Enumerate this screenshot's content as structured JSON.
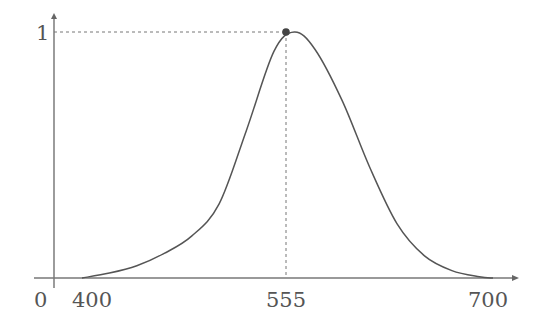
{
  "chart_data": {
    "type": "line",
    "title": "",
    "xlabel": "",
    "ylabel": "",
    "x_ticks": [
      "400",
      "555",
      "700"
    ],
    "y_ticks": [
      "1"
    ],
    "origin_label": "0",
    "xlim": [
      380,
      720
    ],
    "ylim": [
      0,
      1
    ],
    "grid": false,
    "series": [
      {
        "name": "luminosity curve",
        "x": [
          400,
          420,
          440,
          460,
          480,
          500,
          520,
          540,
          555,
          570,
          590,
          610,
          630,
          650,
          670,
          690,
          700
        ],
        "y": [
          0.0,
          0.02,
          0.05,
          0.1,
          0.17,
          0.3,
          0.6,
          0.92,
          1.0,
          0.93,
          0.72,
          0.45,
          0.22,
          0.09,
          0.03,
          0.005,
          0.0
        ]
      }
    ],
    "annotations": [
      {
        "type": "peak-marker",
        "x": 555,
        "y": 1,
        "guides": "dashed"
      }
    ],
    "colors": {
      "curve": "#555555",
      "axis": "#666666",
      "marker": "#444444"
    }
  }
}
